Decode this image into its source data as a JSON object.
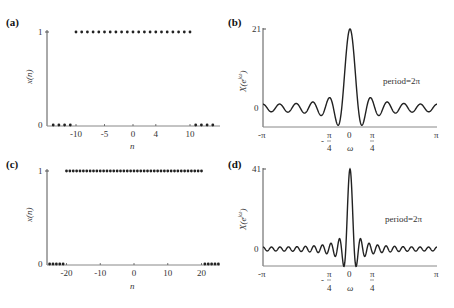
{
  "chart_data": [
    {
      "panel": "(a)",
      "type": "scatter",
      "title": "",
      "xlabel": "n",
      "ylabel": "x(n)",
      "x_ticks": [
        -10,
        -5,
        0,
        4,
        10
      ],
      "y_ticks": [
        0,
        1
      ],
      "xlim": [
        -14,
        14
      ],
      "ylim": [
        0,
        1
      ],
      "x": [
        -14,
        -13,
        -12,
        -11,
        -10,
        -9,
        -8,
        -7,
        -6,
        -5,
        -4,
        -3,
        -2,
        -1,
        0,
        1,
        2,
        3,
        4,
        5,
        6,
        7,
        8,
        9,
        10,
        11,
        12,
        13,
        14
      ],
      "values": [
        0,
        0,
        0,
        0,
        1,
        1,
        1,
        1,
        1,
        1,
        1,
        1,
        1,
        1,
        1,
        1,
        1,
        1,
        1,
        1,
        1,
        1,
        1,
        1,
        1,
        0,
        0,
        0,
        0
      ],
      "description": "Rectangular pulse x(n)=1 for |n|<=10, 0 otherwise"
    },
    {
      "panel": "(b)",
      "type": "line",
      "title": "",
      "xlabel": "ω",
      "ylabel": "X(e^{jω})",
      "x_ticks": [
        "-π",
        "-π/4",
        "0",
        "π/4",
        "π"
      ],
      "y_ticks": [
        0,
        21
      ],
      "xlim": [
        "-π",
        "π"
      ],
      "peak": 21,
      "N": 21,
      "annotation": "period=2π",
      "description": "Dirichlet kernel sin(21ω/2)/sin(ω/2)"
    },
    {
      "panel": "(c)",
      "type": "scatter",
      "title": "",
      "xlabel": "n",
      "ylabel": "x(n)",
      "x_ticks": [
        -20,
        -10,
        0,
        10,
        20
      ],
      "y_ticks": [
        0,
        1
      ],
      "xlim": [
        -25,
        25
      ],
      "ylim": [
        0,
        1
      ],
      "x_range": [
        -25,
        25
      ],
      "ones_range": [
        -20,
        20
      ],
      "description": "Rectangular pulse x(n)=1 for |n|<=20, 0 otherwise"
    },
    {
      "panel": "(d)",
      "type": "line",
      "title": "",
      "xlabel": "ω",
      "ylabel": "X(e^{jω})",
      "x_ticks": [
        "-π",
        "-π/4",
        "0",
        "π/4",
        "π"
      ],
      "y_ticks": [
        0,
        41
      ],
      "xlim": [
        "-π",
        "π"
      ],
      "peak": 41,
      "N": 41,
      "annotation": "period=2π",
      "description": "Dirichlet kernel sin(41ω/2)/sin(ω/2)"
    }
  ],
  "labels": {
    "a": {
      "panel": "(a)",
      "ylabel": "x(n)",
      "xlabel": "n",
      "y1": "1",
      "y0": "0",
      "ticks": [
        "-10",
        "-5",
        "0",
        "4",
        "10"
      ]
    },
    "b": {
      "panel": "(b)",
      "ylabel": "X(e",
      "ylabel_sup": "jω",
      "ylabel_close": ")",
      "xlabel": "ω",
      "ytop": "21",
      "y0": "0",
      "annotation": "period=2π",
      "t_negpi": "-π",
      "t_negpi4_num": "π",
      "t_negpi4_den": "4",
      "t_neg": "-",
      "t_zero": "0",
      "t_pi4_num": "π",
      "t_pi4_den": "4",
      "t_pi": "π"
    },
    "c": {
      "panel": "(c)",
      "ylabel": "x(n)",
      "xlabel": "n",
      "y1": "1",
      "y0": "0",
      "ticks": [
        "-20",
        "-10",
        "0",
        "10",
        "20"
      ]
    },
    "d": {
      "panel": "(d)",
      "ylabel": "X(e",
      "ylabel_sup": "jω",
      "ylabel_close": ")",
      "xlabel": "ω",
      "ytop": "41",
      "y0": "0",
      "annotation": "period=2π",
      "t_negpi": "-π",
      "t_negpi4_num": "π",
      "t_negpi4_den": "4",
      "t_neg": "-",
      "t_zero": "0",
      "t_pi4_num": "π",
      "t_pi4_den": "4",
      "t_pi": "π"
    }
  },
  "style": {
    "line_color": "#222222",
    "axis_color": "#555555",
    "dot_color": "#222222"
  }
}
